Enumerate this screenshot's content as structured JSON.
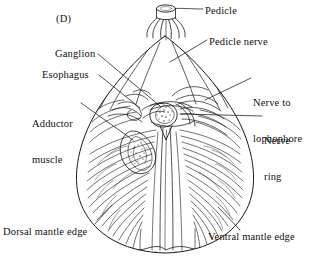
{
  "figure": {
    "panel_letter": "(D)",
    "background_color": "#ffffff",
    "ink_color": "#1a1a18",
    "width": 329,
    "height": 272
  },
  "labels": {
    "pedicle": "Pedicle",
    "pedicle_nerve": "Pedicle nerve",
    "ganglion": "Ganglion",
    "esophagus": "Esophagus",
    "adductor_muscle_line1": "Adductor",
    "adductor_muscle_line2": "muscle",
    "nerve_to_lophophore_line1": "Nerve to",
    "nerve_to_lophophore_line2": "lophophore",
    "nerve_ring_line1": "Nerve",
    "nerve_ring_line2": "ring",
    "dorsal_mantle_edge": "Dorsal mantle edge",
    "ventral_mantle_edge": "Ventral mantle edge"
  }
}
